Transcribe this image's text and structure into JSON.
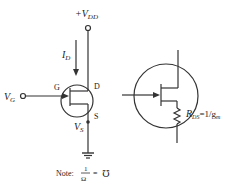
{
  "diagram": {
    "left_circuit": {
      "supply_label": "+V",
      "supply_sub": "DD",
      "current_label": "I",
      "current_sub": "D",
      "gate_input_label": "V",
      "gate_input_sub": "G",
      "gate_terminal": "G",
      "drain_terminal": "D",
      "source_terminal": "S",
      "source_voltage_label": "V",
      "source_voltage_sub": "S"
    },
    "right_circuit": {
      "resistance_label": "R",
      "resistance_sub": "DS",
      "resistance_eq": "=1/g",
      "resistance_eq_sub": "m"
    },
    "note": {
      "prefix": "Note:",
      "numerator": "1",
      "denominator": "Ω",
      "equals": "=",
      "unit_symbol": "℧"
    },
    "colors": {
      "line": "#333333",
      "background": "#ffffff"
    }
  }
}
